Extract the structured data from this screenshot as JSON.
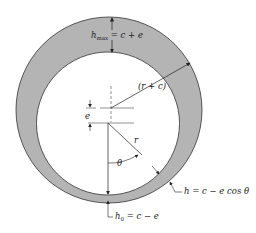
{
  "diagram": {
    "type": "journal-bearing-eccentricity",
    "colors": {
      "film": "#b4b4b4",
      "stroke": "#333333",
      "background": "#ffffff"
    },
    "labels": {
      "h_max_base": "h",
      "h_max_sub": "max",
      "h_max_rhs": " = c + e",
      "outer_radius": "(r + c)",
      "eccentricity": "e",
      "radius": "r",
      "angle": "θ",
      "h_general": "h = c − e cos θ",
      "h0_base": "h",
      "h0_sub": "0",
      "h0_rhs": " = c − e"
    }
  }
}
